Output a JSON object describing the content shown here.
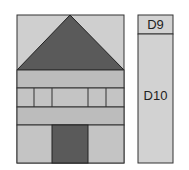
{
  "diagram": {
    "quilt_block": {
      "shapes": [
        {
          "name": "sky-left",
          "color": "#cfcfcf"
        },
        {
          "name": "roof-triangle",
          "color": "#5a5a5a"
        },
        {
          "name": "upper-band",
          "color": "#bcbcbc"
        },
        {
          "name": "window-row",
          "color": "#c4c4c4"
        },
        {
          "name": "lower-band",
          "color": "#bcbcbc"
        },
        {
          "name": "door",
          "color": "#5a5a5a"
        },
        {
          "name": "base-sides",
          "color": "#c4c4c4"
        }
      ]
    },
    "strip": {
      "top_label": "D9",
      "bottom_label": "D10",
      "fill": "#d2d2d2"
    }
  }
}
